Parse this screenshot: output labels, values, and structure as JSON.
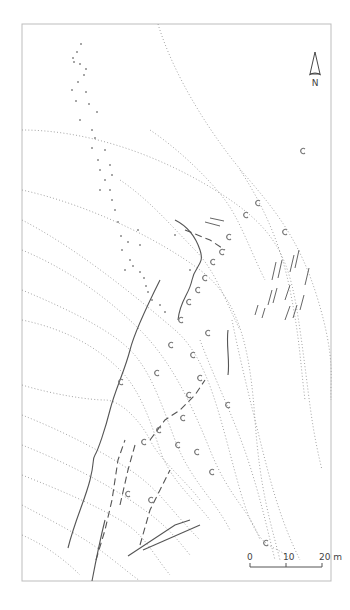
{
  "map": {
    "frame": {
      "x": 22,
      "y": 24,
      "width": 309,
      "height": 557
    },
    "north_arrow": {
      "x": 315,
      "y": 52,
      "label": "N"
    },
    "scale_bar": {
      "x": 250,
      "y": 567,
      "length": 72,
      "ticks": [
        {
          "offset": 0,
          "label": "0"
        },
        {
          "offset": 24,
          "label": "10"
        },
        {
          "offset": 48,
          "label": "20 m"
        }
      ]
    },
    "colors": {
      "contour": "#9a9a9a",
      "feature": "#555555",
      "frame": "#bdbdbd"
    },
    "contours": [
      "M 158 24 C 175 80, 215 140, 245 175 S 300 240, 318 300 S 330 380, 331 400",
      "M 22 130 C 80 130, 150 150, 215 190 S 290 260, 300 330 S 310 420, 322 470",
      "M 22 190 C 90 205, 160 240, 200 270 S 250 350, 255 420 S 270 520, 280 560",
      "M 22 220 C 80 250, 140 300, 175 330 S 220 420, 240 490 S 275 540, 290 560",
      "M 22 250 C 70 270, 110 300, 140 330 S 190 400, 210 450 S 250 510, 260 540",
      "M 22 290 C 70 310, 110 330, 130 350 S 160 400, 175 440 S 215 500, 230 530",
      "M 22 320 C 70 330, 100 350, 120 370 S 150 420, 160 450 S 195 500, 210 520",
      "M 22 385 C 55 395, 90 400, 105 400 S 140 420, 150 440 S 185 480, 200 500",
      "M 22 415 C 60 430, 100 450, 130 470 S 170 510, 200 540",
      "M 22 445 C 60 460, 100 480, 130 500 S 170 530, 190 555",
      "M 22 475 C 60 490, 95 505, 120 520 S 150 550, 170 575",
      "M 22 505 C 50 520, 80 535, 100 550 S 125 570, 140 581",
      "M 22 535 C 45 545, 65 560, 80 575",
      "M 150 130 C 180 150, 210 180, 225 200 S 250 250, 265 280",
      "M 120 180 C 150 200, 175 230, 195 250 S 225 300, 240 330",
      "M 240 170 C 260 200, 280 240, 290 290 S 300 360, 305 400",
      "M 232 320 C 240 360, 250 400, 260 440 S 280 520, 300 560",
      "M 200 340 C 215 380, 235 420, 248 460 S 265 520, 275 560"
    ],
    "features_solid": [
      "M 68 548 C 75 520, 85 500, 90 480 S 92 460, 95 455 S 105 430, 110 410 S 125 370, 130 350 S 150 300, 160 280",
      "M 92 581 C 96 560, 100 540, 105 520",
      "M 175 220 C 185 225, 195 235, 200 250 S 195 265, 192 280 S 180 300, 178 320",
      "M 228 330 C 226 345, 230 360, 228 375",
      "M 128 556 L 175 525 L 190 520",
      "M 143 550 L 200 525"
    ],
    "features_dash": [
      "M 96 560 L 105 530 L 112 500 L 118 460 L 125 440",
      "M 140 545 L 150 510 L 160 490 L 170 470",
      "M 150 440 L 165 420 L 180 410 L 195 395 L 205 380",
      "M 120 505 L 128 470 L 135 445",
      "M 185 230 L 210 240 L 225 250"
    ],
    "strokes": [
      [
        272,
        280,
        276,
        262
      ],
      [
        278,
        278,
        282,
        260
      ],
      [
        290,
        272,
        294,
        255
      ],
      [
        295,
        268,
        299,
        250
      ],
      [
        268,
        305,
        272,
        290
      ],
      [
        273,
        303,
        277,
        288
      ],
      [
        285,
        300,
        290,
        285
      ],
      [
        300,
        310,
        304,
        295
      ],
      [
        305,
        285,
        309,
        268
      ],
      [
        285,
        320,
        290,
        306
      ],
      [
        293,
        318,
        297,
        305
      ],
      [
        255,
        315,
        258,
        305
      ],
      [
        262,
        318,
        265,
        308
      ],
      [
        205,
        222,
        220,
        226
      ],
      [
        210,
        218,
        224,
        221
      ]
    ],
    "points": [
      [
        81,
        44
      ],
      [
        77,
        52
      ],
      [
        73,
        58
      ],
      [
        74,
        62
      ],
      [
        80,
        64
      ],
      [
        86,
        69
      ],
      [
        84,
        75
      ],
      [
        78,
        82
      ],
      [
        72,
        90
      ],
      [
        86,
        92
      ],
      [
        76,
        101
      ],
      [
        89,
        104
      ],
      [
        97,
        112
      ],
      [
        80,
        120
      ],
      [
        92,
        130
      ],
      [
        95,
        138
      ],
      [
        92,
        148
      ],
      [
        105,
        150
      ],
      [
        98,
        160
      ],
      [
        100,
        170
      ],
      [
        105,
        180
      ],
      [
        110,
        190
      ],
      [
        112,
        200
      ],
      [
        115,
        210
      ],
      [
        118,
        222
      ],
      [
        121,
        236
      ],
      [
        128,
        242
      ],
      [
        122,
        250
      ],
      [
        130,
        260
      ],
      [
        133,
        266
      ],
      [
        140,
        272
      ],
      [
        144,
        278
      ],
      [
        146,
        286
      ],
      [
        148,
        292
      ],
      [
        152,
        300
      ],
      [
        160,
        305
      ],
      [
        165,
        312
      ],
      [
        110,
        165
      ],
      [
        112,
        175
      ],
      [
        100,
        190
      ],
      [
        138,
        230
      ],
      [
        140,
        245
      ],
      [
        125,
        270
      ],
      [
        175,
        235
      ],
      [
        190,
        270
      ]
    ],
    "c_marks": [
      [
        303,
        151
      ],
      [
        258,
        203
      ],
      [
        246,
        215
      ],
      [
        285,
        232
      ],
      [
        229,
        237
      ],
      [
        222,
        252
      ],
      [
        213,
        262
      ],
      [
        205,
        278
      ],
      [
        198,
        290
      ],
      [
        189,
        302
      ],
      [
        181,
        320
      ],
      [
        171,
        345
      ],
      [
        208,
        333
      ],
      [
        193,
        355
      ],
      [
        200,
        378
      ],
      [
        121,
        382
      ],
      [
        157,
        373
      ],
      [
        189,
        395
      ],
      [
        228,
        405
      ],
      [
        183,
        418
      ],
      [
        159,
        430
      ],
      [
        144,
        442
      ],
      [
        178,
        445
      ],
      [
        197,
        452
      ],
      [
        212,
        472
      ],
      [
        128,
        494
      ],
      [
        151,
        500
      ],
      [
        266,
        543
      ]
    ]
  }
}
